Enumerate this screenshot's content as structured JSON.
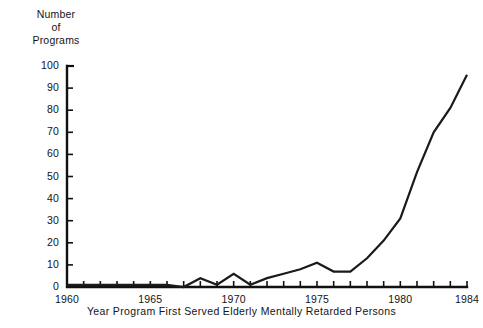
{
  "chart_data": {
    "type": "line",
    "title": "",
    "subtitle": "",
    "ylabel_lines": [
      "Number",
      "of",
      "Programs"
    ],
    "ylabel": "Number of Programs",
    "xlabel": "Year Program First Served Elderly Mentally Retarded Persons",
    "grid": false,
    "legend": null,
    "xlim": [
      1960,
      1984
    ],
    "ylim": [
      0,
      100
    ],
    "yticks": [
      0,
      10,
      20,
      30,
      40,
      50,
      60,
      70,
      80,
      90,
      100
    ],
    "ytick_labels": [
      "0",
      "10",
      "20",
      "30",
      "40",
      "50",
      "60",
      "70",
      "80",
      "90",
      "100"
    ],
    "xticks": [
      1960,
      1961,
      1962,
      1963,
      1964,
      1965,
      1966,
      1967,
      1968,
      1969,
      1970,
      1971,
      1972,
      1973,
      1974,
      1975,
      1976,
      1977,
      1978,
      1979,
      1980,
      1981,
      1982,
      1983,
      1984
    ],
    "xtick_labels_shown": [
      "1960",
      "1965",
      "1970",
      "1975",
      "1980",
      "1984"
    ],
    "xtick_labels_shown_values": [
      1960,
      1965,
      1970,
      1975,
      1980,
      1984
    ],
    "x": [
      1960,
      1961,
      1962,
      1963,
      1964,
      1965,
      1966,
      1967,
      1968,
      1969,
      1970,
      1971,
      1972,
      1973,
      1974,
      1975,
      1976,
      1977,
      1978,
      1979,
      1980,
      1981,
      1982,
      1983,
      1984
    ],
    "values": [
      1,
      1,
      1,
      1,
      1,
      1,
      1,
      0,
      4,
      1,
      6,
      1,
      4,
      6,
      8,
      11,
      7,
      7,
      13,
      21,
      31,
      52,
      70,
      81,
      96
    ],
    "series": [
      {
        "name": "Number of Programs",
        "values": [
          1,
          1,
          1,
          1,
          1,
          1,
          1,
          0,
          4,
          1,
          6,
          1,
          4,
          6,
          8,
          11,
          7,
          7,
          13,
          21,
          31,
          52,
          70,
          81,
          96
        ]
      }
    ],
    "line_color": "#1a1a1a",
    "line_width": 2.2
  },
  "figure": {
    "background": "#ffffff",
    "axis_color": "#111111"
  }
}
